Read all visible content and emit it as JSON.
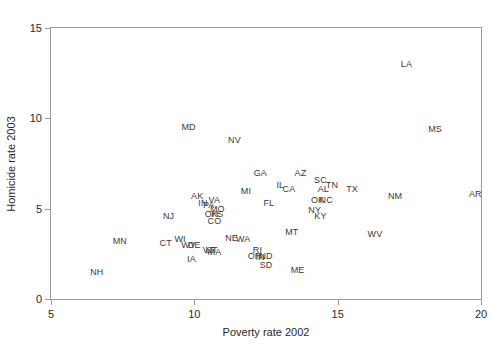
{
  "chart_data": {
    "type": "scatter",
    "title": "",
    "xlabel": "Poverty rate 2002",
    "ylabel": "Homicide rate 2003",
    "xlim": [
      5,
      20
    ],
    "ylim": [
      0,
      15
    ],
    "xticks": [
      5,
      10,
      15,
      20
    ],
    "yticks": [
      0,
      5,
      10,
      15
    ],
    "xtick_labels": [
      "5",
      "10",
      "15",
      "20"
    ],
    "ytick_labels": [
      "0",
      "5",
      "10",
      "15"
    ],
    "grid": false,
    "legend": null,
    "marker_style": "text-labels",
    "point_color": "#3a3a3a",
    "frame_color": "#9a9a9a",
    "note": "Each data point is drawn as the two-letter US state postal abbreviation rather than a marker symbol.",
    "points": [
      {
        "label": "LA",
        "x": 17.4,
        "y": 13.0
      },
      {
        "label": "MS",
        "x": 18.4,
        "y": 9.4
      },
      {
        "label": "MD",
        "x": 9.8,
        "y": 9.5
      },
      {
        "label": "NV",
        "x": 11.4,
        "y": 8.8
      },
      {
        "label": "GA",
        "x": 12.3,
        "y": 7.0
      },
      {
        "label": "AZ",
        "x": 13.7,
        "y": 7.0
      },
      {
        "label": "SC",
        "x": 14.4,
        "y": 6.6
      },
      {
        "label": "IL",
        "x": 13.0,
        "y": 6.3
      },
      {
        "label": "CA",
        "x": 13.3,
        "y": 6.1
      },
      {
        "label": "TN",
        "x": 14.8,
        "y": 6.3
      },
      {
        "label": "AL",
        "x": 14.5,
        "y": 6.1
      },
      {
        "label": "TX",
        "x": 15.5,
        "y": 6.1
      },
      {
        "label": "NM",
        "x": 17.0,
        "y": 5.7
      },
      {
        "label": "AR",
        "x": 19.8,
        "y": 5.8
      },
      {
        "label": "MI",
        "x": 11.8,
        "y": 6.0
      },
      {
        "label": "OK",
        "x": 14.3,
        "y": 5.5
      },
      {
        "label": "NC",
        "x": 14.6,
        "y": 5.5
      },
      {
        "label": "FL",
        "x": 12.6,
        "y": 5.3
      },
      {
        "label": "AK",
        "x": 10.1,
        "y": 5.7
      },
      {
        "label": "VA",
        "x": 10.7,
        "y": 5.5
      },
      {
        "label": "IN",
        "x": 10.3,
        "y": 5.3
      },
      {
        "label": "PA",
        "x": 10.5,
        "y": 5.2
      },
      {
        "label": "MO",
        "x": 10.8,
        "y": 5.0
      },
      {
        "label": "OH",
        "x": 10.6,
        "y": 4.7
      },
      {
        "label": "KS",
        "x": 10.8,
        "y": 4.7
      },
      {
        "label": "NY",
        "x": 14.2,
        "y": 4.9
      },
      {
        "label": "KY",
        "x": 14.4,
        "y": 4.6
      },
      {
        "label": "NJ",
        "x": 9.1,
        "y": 4.6
      },
      {
        "label": "CO",
        "x": 10.7,
        "y": 4.3
      },
      {
        "label": "MT",
        "x": 13.4,
        "y": 3.7
      },
      {
        "label": "WV",
        "x": 16.3,
        "y": 3.6
      },
      {
        "label": "NE",
        "x": 11.3,
        "y": 3.4
      },
      {
        "label": "WA",
        "x": 11.7,
        "y": 3.3
      },
      {
        "label": "MN",
        "x": 7.4,
        "y": 3.2
      },
      {
        "label": "WI",
        "x": 9.5,
        "y": 3.3
      },
      {
        "label": "CT",
        "x": 9.0,
        "y": 3.1
      },
      {
        "label": "WY",
        "x": 9.8,
        "y": 3.0
      },
      {
        "label": "DE",
        "x": 10.0,
        "y": 3.0
      },
      {
        "label": "UT",
        "x": 10.6,
        "y": 2.7
      },
      {
        "label": "VT",
        "x": 10.5,
        "y": 2.7
      },
      {
        "label": "MA",
        "x": 10.7,
        "y": 2.6
      },
      {
        "label": "RI",
        "x": 12.2,
        "y": 2.7
      },
      {
        "label": "OR",
        "x": 12.1,
        "y": 2.4
      },
      {
        "label": "ND",
        "x": 12.5,
        "y": 2.4
      },
      {
        "label": "IN2",
        "x": 12.3,
        "y": 2.3
      },
      {
        "label": "SD",
        "x": 12.5,
        "y": 1.9
      },
      {
        "label": "IA",
        "x": 9.9,
        "y": 2.2
      },
      {
        "label": "NH",
        "x": 6.6,
        "y": 1.5
      },
      {
        "label": "ME",
        "x": 13.6,
        "y": 1.6
      }
    ]
  }
}
